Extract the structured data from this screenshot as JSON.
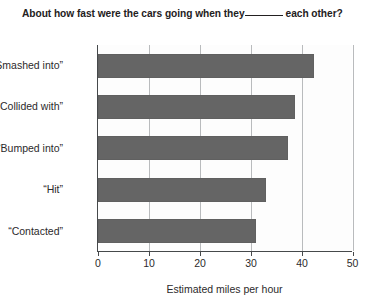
{
  "chart_data": {
    "type": "bar",
    "orientation": "horizontal",
    "title": "About how fast were the cars going when they",
    "title_blank": "_____",
    "title_suffix": "each other?",
    "categories": [
      "“Smashed into”",
      "“Collided with”",
      "“Bumped into”",
      "“Hit”",
      "“Contacted”"
    ],
    "values": [
      42.3,
      38.7,
      37.3,
      33.0,
      31.0
    ],
    "xlabel": "Estimated miles per hour",
    "ylabel": "",
    "xlim": [
      0,
      50
    ],
    "xticks": [
      0,
      10,
      20,
      30,
      40,
      50
    ],
    "xtick_labels": [
      "0",
      "10",
      "20",
      "30",
      "40",
      "50"
    ],
    "grid": true,
    "grid_axis": "x",
    "legend": null,
    "bar_color": "#656565",
    "axis_color": "#46494b",
    "grid_color": "#b9bbbd",
    "background": "#ffffff"
  }
}
